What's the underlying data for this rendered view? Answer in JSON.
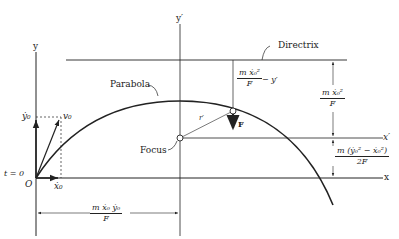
{
  "diagram": {
    "type": "physics-parabolic-trajectory",
    "labels": {
      "y_axis": "y",
      "y_prime_axis": "y′",
      "x_axis": "x",
      "x_prime_axis": "x′",
      "directrix": "Directrix",
      "parabola": "Parabola",
      "focus": "Focus",
      "origin": "O",
      "t_zero": "t = 0",
      "velocity": "v₀",
      "ydot0": "ẏ₀",
      "xdot0": "ẋ₀",
      "r_prime": "r′",
      "force": "F"
    },
    "dimensions": {
      "directrix_height": {
        "numerator": "m ẋ₀²",
        "denominator": "F"
      },
      "distance_to_directrix": {
        "numerator": "m ẋ₀²",
        "denominator": "F",
        "suffix": "− y′"
      },
      "vertex_height": {
        "numerator": "m (ẏ₀² − ẋ₀²)",
        "denominator": "2F"
      },
      "horizontal_offset": {
        "numerator": "m ẋ₀ ẏ₀",
        "denominator": "F"
      }
    },
    "colors": {
      "line": "#222222",
      "background": "#ffffff"
    }
  }
}
